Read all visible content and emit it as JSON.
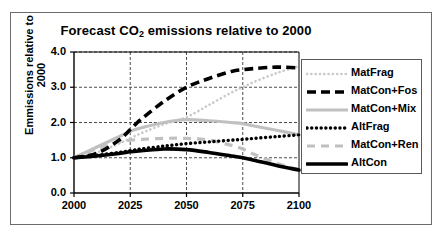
{
  "figure": {
    "border_color": "#6b6b6b"
  },
  "title": {
    "prefix": "Forecast CO",
    "subscript": "2",
    "suffix": " emissions relative to 2000",
    "full": "Forecast CO2 emissions relative to 2000"
  },
  "axes": {
    "y_title_line1": "Emmissions relative to",
    "y_title_line2": "2000",
    "y_ticks": [
      "0.0",
      "1.0",
      "2.0",
      "3.0",
      "4.0"
    ],
    "x_ticks": [
      "2000",
      "2025",
      "2050",
      "2075",
      "2100"
    ]
  },
  "legend": {
    "items": [
      {
        "label": "MatFrag",
        "color": "#c9c9c9",
        "style": "dotted-fine"
      },
      {
        "label": "MatCon+Fos",
        "color": "#000000",
        "style": "dashed-thick"
      },
      {
        "label": "MatCon+Mix",
        "color": "#c0c0c0",
        "style": "solid-thick"
      },
      {
        "label": "AltFrag",
        "color": "#000000",
        "style": "dotted-thick"
      },
      {
        "label": "MatCon+Ren",
        "color": "#c0c0c0",
        "style": "dashed-medium"
      },
      {
        "label": "AltCon",
        "color": "#000000",
        "style": "solid-extra-thick"
      }
    ]
  },
  "chart_data": {
    "type": "line",
    "title": "Forecast CO2 emissions relative to 2000",
    "xlabel": "",
    "ylabel": "Emmissions relative to 2000",
    "xlim": [
      2000,
      2100
    ],
    "ylim": [
      0.0,
      4.0
    ],
    "x_ticks": [
      2000,
      2025,
      2050,
      2075,
      2100
    ],
    "y_ticks": [
      0.0,
      1.0,
      2.0,
      3.0,
      4.0
    ],
    "grid": true,
    "legend_position": "right",
    "x": [
      2000,
      2010,
      2020,
      2025,
      2030,
      2040,
      2050,
      2060,
      2070,
      2075,
      2080,
      2090,
      2100
    ],
    "series": [
      {
        "name": "MatFrag",
        "color": "#c9c9c9",
        "style": "dotted-fine",
        "values": [
          1.0,
          1.15,
          1.4,
          1.55,
          1.7,
          1.95,
          2.15,
          2.5,
          2.85,
          3.0,
          3.15,
          3.4,
          3.6
        ]
      },
      {
        "name": "MatCon+Fos",
        "color": "#000000",
        "style": "dashed-thick",
        "values": [
          1.0,
          1.12,
          1.5,
          1.8,
          2.1,
          2.6,
          3.0,
          3.25,
          3.45,
          3.5,
          3.53,
          3.57,
          3.55
        ]
      },
      {
        "name": "MatCon+Mix",
        "color": "#c0c0c0",
        "style": "solid-thick",
        "values": [
          1.0,
          1.3,
          1.6,
          1.75,
          1.85,
          2.0,
          2.08,
          2.05,
          2.0,
          1.97,
          1.9,
          1.78,
          1.65
        ]
      },
      {
        "name": "AltFrag",
        "color": "#000000",
        "style": "dotted-thick",
        "values": [
          1.0,
          1.07,
          1.15,
          1.2,
          1.25,
          1.33,
          1.4,
          1.45,
          1.5,
          1.52,
          1.55,
          1.6,
          1.65
        ]
      },
      {
        "name": "MatCon+Ren",
        "color": "#c0c0c0",
        "style": "dashed-medium",
        "values": [
          1.0,
          1.25,
          1.45,
          1.5,
          1.52,
          1.55,
          1.55,
          1.5,
          1.35,
          1.25,
          1.1,
          0.85,
          0.65
        ]
      },
      {
        "name": "AltCon",
        "color": "#000000",
        "style": "solid-extra-thick",
        "values": [
          1.0,
          1.05,
          1.12,
          1.17,
          1.2,
          1.25,
          1.23,
          1.15,
          1.05,
          1.0,
          0.93,
          0.78,
          0.65
        ]
      }
    ]
  }
}
